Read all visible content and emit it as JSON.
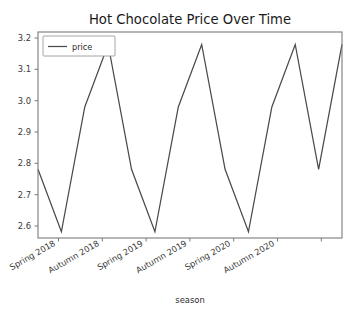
{
  "chart_data": {
    "type": "line",
    "title": "Hot Chocolate Price Over Time",
    "xlabel": "season",
    "ylabel": "",
    "grid": false,
    "legend_position": "upper left",
    "legend_entries": [
      "price"
    ],
    "line_color": "#4a4a4a",
    "categories": [
      "Spring 2018",
      "Autumn 2018",
      "Spring 2019",
      "Autumn 2019",
      "Spring 2020",
      "Autumn 2020"
    ],
    "xtick_labels": [
      "Spring 2018",
      "Autumn 2018",
      "Spring 2019",
      "Autumn 2019",
      "Spring 2020",
      "Autumn 2020"
    ],
    "ytick_labels": [
      "2.6",
      "2.7",
      "2.8",
      "2.9",
      "3.0",
      "3.1",
      "3.2"
    ],
    "ytick_values": [
      2.6,
      2.7,
      2.8,
      2.9,
      3.0,
      3.1,
      3.2
    ],
    "ylim": [
      2.58,
      3.24
    ],
    "xlim": [
      0,
      13
    ],
    "series": [
      {
        "name": "price",
        "x": [
          0,
          1,
          2,
          3,
          4,
          5,
          6,
          7,
          8,
          9,
          10,
          11,
          12,
          13
        ],
        "values": [
          2.8,
          2.6,
          3.0,
          3.2,
          2.8,
          2.6,
          3.0,
          3.2,
          2.8,
          2.6,
          3.0,
          3.2,
          2.8,
          3.2
        ]
      }
    ],
    "annotations": []
  },
  "figure": {
    "title": "Hot Chocolate Price Over Time",
    "xaxis_label": "season",
    "legend_label": "price",
    "ytick_0": "2.6",
    "ytick_1": "2.7",
    "ytick_2": "2.8",
    "ytick_3": "2.9",
    "ytick_4": "3.0",
    "ytick_5": "3.1",
    "ytick_6": "3.2",
    "xtick_0": "Spring 2018",
    "xtick_1": "Autumn 2018",
    "xtick_2": "Spring 2019",
    "xtick_3": "Autumn 2019",
    "xtick_4": "Spring 2020",
    "xtick_5": "Autumn 2020"
  }
}
